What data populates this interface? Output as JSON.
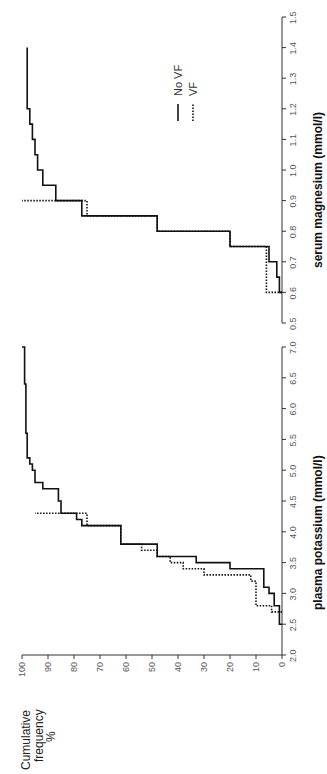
{
  "figure": {
    "orientation": "rotated 90 degrees counter-clockwise",
    "y_axis_label_lines": [
      "Cumulative",
      "frequency",
      "%"
    ],
    "legend": [
      {
        "label": "No VF",
        "style": "solid"
      },
      {
        "label": "VF",
        "style": "dotted"
      }
    ]
  },
  "chart_data": [
    {
      "type": "line",
      "step": true,
      "title": "",
      "xlabel": "plasma potassium (mmol/l)",
      "ylabel": "Cumulative frequency %",
      "xlim": [
        2.0,
        7.0
      ],
      "ylim": [
        0,
        100
      ],
      "xticks": [
        "2.0",
        "2.5",
        "3.0",
        "3.5",
        "4.0",
        "4.5",
        "5.0",
        "5.5",
        "6.0",
        "6.5",
        "7.0"
      ],
      "yticks": [
        "0",
        "10",
        "20",
        "30",
        "40",
        "50",
        "60",
        "70",
        "80",
        "90",
        "100"
      ],
      "grid": false,
      "series": [
        {
          "name": "No VF",
          "style": "solid",
          "x": [
            2.5,
            2.8,
            3.0,
            3.1,
            3.4,
            3.5,
            3.6,
            3.8,
            4.1,
            4.2,
            4.3,
            4.5,
            4.7,
            4.8,
            5.0,
            5.1,
            5.2,
            5.6,
            6.4,
            7.0
          ],
          "y": [
            1,
            3,
            5,
            7,
            20,
            33,
            48,
            62,
            77,
            79,
            85,
            86,
            92,
            95,
            96,
            97,
            98,
            98.5,
            99,
            100
          ]
        },
        {
          "name": "VF",
          "style": "dotted",
          "x": [
            2.7,
            2.8,
            3.2,
            3.3,
            3.4,
            3.5,
            3.6,
            3.7,
            3.8,
            4.1,
            4.3
          ],
          "y": [
            4,
            10,
            12,
            30,
            38,
            43,
            48,
            54,
            62,
            75,
            95
          ]
        }
      ]
    },
    {
      "type": "line",
      "step": true,
      "title": "",
      "xlabel": "serum magnesium (mmol/l)",
      "ylabel": "Cumulative frequency %",
      "xlim": [
        0.5,
        1.5
      ],
      "ylim": [
        0,
        100
      ],
      "xticks": [
        "0.5",
        "0.6",
        "0.7",
        "0.8",
        "0.9",
        "1.0",
        "1.1",
        "1.2",
        "1.3",
        "1.4",
        "1.5"
      ],
      "yticks": [
        "0",
        "10",
        "20",
        "30",
        "40",
        "50",
        "60",
        "70",
        "80",
        "90",
        "100"
      ],
      "grid": false,
      "series": [
        {
          "name": "No VF",
          "style": "solid",
          "x": [
            0.6,
            0.65,
            0.7,
            0.75,
            0.8,
            0.85,
            0.9,
            0.95,
            1.0,
            1.05,
            1.1,
            1.15,
            1.2,
            1.4
          ],
          "y": [
            1,
            2,
            5,
            20,
            48,
            77,
            87,
            92,
            94,
            95,
            96,
            97,
            98,
            98
          ]
        },
        {
          "name": "VF",
          "style": "dotted",
          "x": [
            0.6,
            0.75,
            0.8,
            0.85,
            0.9
          ],
          "y": [
            6,
            20,
            48,
            75,
            100
          ]
        }
      ]
    }
  ]
}
